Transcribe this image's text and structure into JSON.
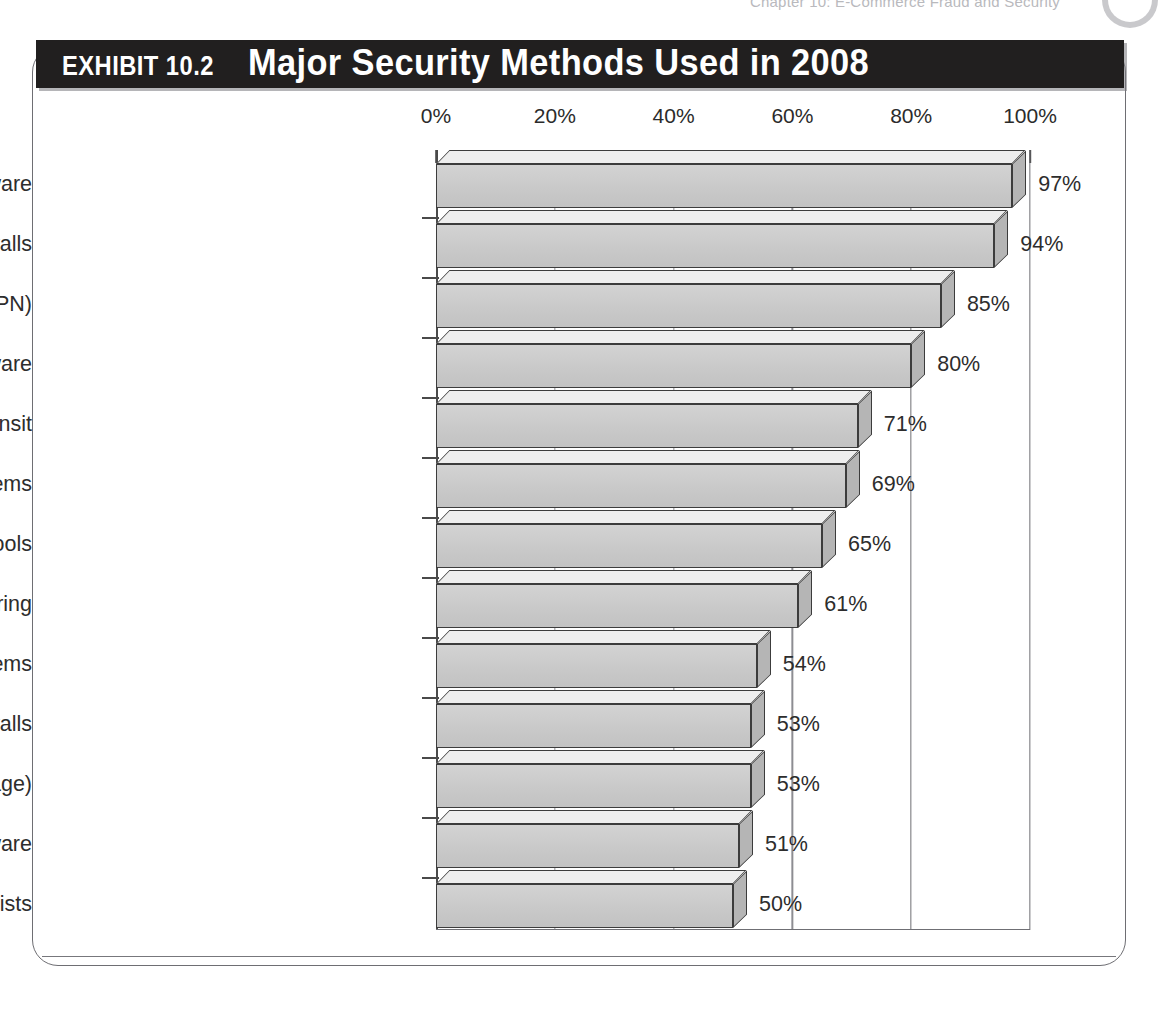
{
  "page": {
    "running_header": "Chapter 10:  E-Commerce Fraud and Security"
  },
  "exhibit": {
    "label": "EXHIBIT 10.2",
    "title": "Major Security Methods Used in 2008"
  },
  "chart_data": {
    "type": "bar",
    "orientation": "horizontal",
    "title": "Major Security Methods Used in 2008",
    "xlabel": "",
    "ylabel": "",
    "xlim": [
      0,
      100
    ],
    "grid": true,
    "legend": "none",
    "value_suffix": "%",
    "xtick_labels": [
      "0%",
      "20%",
      "40%",
      "60%",
      "80%",
      "100%"
    ],
    "xticks": [
      0,
      20,
      40,
      60,
      80,
      100
    ],
    "categories": [
      "Antivirus software",
      "Firewalls",
      "Virtual private network (VPN)",
      "Anti-spyware software",
      "Encryption of data transit",
      "Intrusion detection systems",
      "Vulnerability/patch management tools",
      "Web/URL filtering",
      "Intrusion prevention systems",
      "Application-level firewalls",
      "Encryption of data at rest (in storage)",
      "Log management software",
      "Server-based access control lists"
    ],
    "values": [
      97,
      94,
      85,
      80,
      71,
      69,
      65,
      61,
      54,
      53,
      53,
      51,
      50
    ],
    "value_labels": [
      "97%",
      "94%",
      "85%",
      "80%",
      "71%",
      "69%",
      "65%",
      "61%",
      "54%",
      "53%",
      "53%",
      "51%",
      "50%"
    ],
    "colors": {
      "bar_front": "#c9c9c9",
      "bar_top": "#eeeeee",
      "bar_side": "#b5b5b5",
      "bar_outline": "#3c3c3c",
      "banner_background": "#211f1f",
      "banner_text": "#ffffff",
      "text": "#2d2d2d",
      "gridline": "#8d8d92"
    }
  }
}
